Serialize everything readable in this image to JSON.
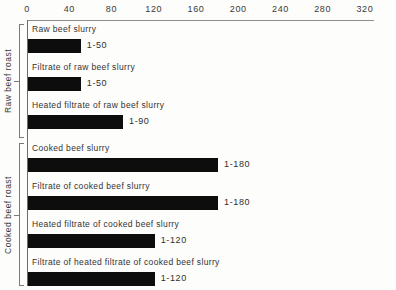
{
  "chart_data": {
    "type": "bar",
    "orientation": "horizontal",
    "title": "",
    "xlabel": "",
    "ylabel": "",
    "xlim": [
      0,
      320
    ],
    "grid": false,
    "legend": null,
    "axis_position": "top",
    "ticks": [
      {
        "label": "0",
        "value": 0
      },
      {
        "label": "40",
        "value": 40
      },
      {
        "label": "80",
        "value": 80
      },
      {
        "label": "120",
        "value": 120
      },
      {
        "label": "160",
        "value": 160
      },
      {
        "label": "200",
        "value": 200
      },
      {
        "label": "240",
        "value": 240
      },
      {
        "label": "280",
        "value": 280
      },
      {
        "label": "320",
        "value": 320
      }
    ],
    "categories": [
      "Raw beef slurry",
      "Filtrate of raw beef slurry",
      "Heated filtrate of raw beef slurry",
      "Cooked beef slurry",
      "Filtrate of cooked beef slurry",
      "Heated filtrate of cooked beef slurry",
      "Filtrate of heated filtrate of cooked beef slurry"
    ],
    "values": [
      50,
      50,
      90,
      180,
      180,
      120,
      120
    ],
    "value_labels": [
      "1-50",
      "1-50",
      "1-90",
      "1-180",
      "1-180",
      "1-120",
      "1-120"
    ],
    "bar_color": "#0d0d0d",
    "groups": [
      {
        "label": "Raw beef roast",
        "rows": [
          {
            "label": "Raw beef slurry",
            "value": 50,
            "value_label": "1-50"
          },
          {
            "label": "Filtrate of raw beef slurry",
            "value": 50,
            "value_label": "1-50"
          },
          {
            "label": "Heated filtrate of raw beef slurry",
            "value": 90,
            "value_label": "1-90"
          }
        ]
      },
      {
        "label": "Cooked beef roast",
        "rows": [
          {
            "label": "Cooked beef slurry",
            "value": 180,
            "value_label": "1-180"
          },
          {
            "label": "Filtrate of cooked beef slurry",
            "value": 180,
            "value_label": "1-180"
          },
          {
            "label": "Heated filtrate of cooked beef slurry",
            "value": 120,
            "value_label": "1-120"
          },
          {
            "label": "Filtrate of heated filtrate of cooked beef slurry",
            "value": 120,
            "value_label": "1-120"
          }
        ]
      }
    ]
  },
  "layout": {
    "axis_origin_x": 27,
    "axis_top_y": 20,
    "px_per_unit": 1.056,
    "bar_height": 14,
    "row_pitch": 38,
    "group_tops": [
      24,
      143
    ],
    "group_heights": [
      114,
      143
    ]
  }
}
